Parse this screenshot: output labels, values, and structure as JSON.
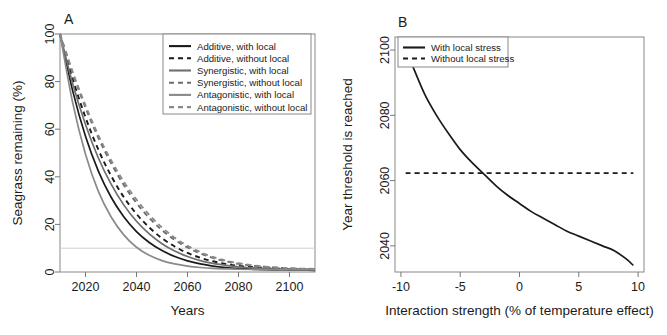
{
  "figure": {
    "panels": [
      "A",
      "B"
    ]
  },
  "chart_data": [
    {
      "type": "line",
      "panel_letter": "A",
      "title": "",
      "xlabel": "Years",
      "ylabel": "Seagrass remaining (%)",
      "xlim": [
        2010,
        2110
      ],
      "ylim": [
        0,
        100
      ],
      "xticks": [
        2020,
        2040,
        2060,
        2080,
        2100
      ],
      "yticks": [
        0,
        20,
        40,
        60,
        80,
        100
      ],
      "grid": false,
      "legend_position": "top-right",
      "annotations": [
        {
          "name": "threshold-line",
          "type": "hline",
          "y": 10,
          "color": "#d0d0d0",
          "style": "solid"
        }
      ],
      "x": [
        2010,
        2015,
        2020,
        2025,
        2030,
        2035,
        2040,
        2045,
        2050,
        2055,
        2060,
        2065,
        2070,
        2075,
        2080,
        2085,
        2090,
        2095,
        2100,
        2105,
        2110
      ],
      "series": [
        {
          "name": "Additive, with local",
          "color": "#1a1a1a",
          "style": "solid",
          "values": [
            100,
            76,
            57,
            42.5,
            31.5,
            23.2,
            17.0,
            12.4,
            9.0,
            6.5,
            4.7,
            3.4,
            2.5,
            1.9,
            1.5,
            1.2,
            1.0,
            0.9,
            0.8,
            0.75,
            0.7
          ]
        },
        {
          "name": "Additive, without local",
          "color": "#1a1a1a",
          "style": "dashed",
          "values": [
            100,
            81,
            65,
            51.5,
            40.5,
            31.5,
            24.4,
            18.7,
            14.2,
            10.7,
            8.0,
            6.0,
            4.5,
            3.4,
            2.6,
            2.1,
            1.7,
            1.4,
            1.2,
            1.1,
            1.0
          ]
        },
        {
          "name": "Synergistic, with local",
          "color": "#6e6e6e",
          "style": "solid",
          "values": [
            100,
            79,
            62,
            48,
            37,
            28.2,
            21.3,
            16.0,
            11.9,
            8.8,
            6.5,
            4.8,
            3.6,
            2.8,
            2.2,
            1.8,
            1.5,
            1.3,
            1.2,
            1.1,
            1.05
          ]
        },
        {
          "name": "Synergistic, without local",
          "color": "#6e6e6e",
          "style": "dashed",
          "values": [
            100,
            83.5,
            69,
            56.5,
            45.8,
            36.6,
            29.0,
            22.7,
            17.6,
            13.5,
            10.3,
            7.8,
            5.9,
            4.5,
            3.4,
            2.7,
            2.2,
            1.8,
            1.5,
            1.3,
            1.2
          ]
        },
        {
          "name": "Antagonistic, with local",
          "color": "#8a8a8a",
          "style": "solid",
          "values": [
            100,
            71,
            49.5,
            34,
            23.2,
            15.6,
            10.4,
            7.0,
            4.8,
            3.4,
            2.5,
            1.9,
            1.5,
            1.3,
            1.15,
            1.05,
            1.0,
            0.95,
            0.9,
            0.88,
            0.85
          ]
        },
        {
          "name": "Antagonistic, without local",
          "color": "#8a8a8a",
          "style": "dashed",
          "values": [
            100,
            84,
            70,
            57.5,
            47,
            38,
            30.4,
            24.0,
            18.7,
            14.4,
            11.0,
            8.4,
            6.3,
            4.8,
            3.7,
            2.9,
            2.3,
            1.9,
            1.6,
            1.4,
            1.3
          ]
        }
      ]
    },
    {
      "type": "line",
      "panel_letter": "B",
      "title": "",
      "xlabel": "Interaction strength (% of temperature effect)",
      "ylabel": "Year threshold is reached",
      "xlim": [
        -10.5,
        10.5
      ],
      "ylim": [
        2032,
        2104
      ],
      "xticks": [
        -10,
        -5,
        0,
        5,
        10
      ],
      "yticks": [
        2040,
        2060,
        2080,
        2100
      ],
      "grid": false,
      "legend_position": "top-left",
      "x": [
        -9.6,
        -9,
        -8,
        -7,
        -6,
        -5,
        -4,
        -3,
        -2,
        -1,
        0,
        1,
        2,
        3,
        4,
        5,
        6,
        7,
        8,
        9,
        9.6
      ],
      "series": [
        {
          "name": "With local stress",
          "color": "#1a1a1a",
          "style": "solid",
          "values": [
            2100.5,
            2095,
            2086.5,
            2080,
            2074.5,
            2069.5,
            2065.5,
            2062,
            2058.5,
            2055.5,
            2053,
            2050.5,
            2048.5,
            2046.5,
            2044.5,
            2043,
            2041.5,
            2040,
            2038.5,
            2036,
            2034
          ]
        },
        {
          "name": "Without local stress",
          "color": "#1a1a1a",
          "style": "dashed",
          "constant": 2062.3,
          "values": [
            2062.3,
            2062.3,
            2062.3,
            2062.3,
            2062.3,
            2062.3,
            2062.3,
            2062.3,
            2062.3,
            2062.3,
            2062.3,
            2062.3,
            2062.3,
            2062.3,
            2062.3,
            2062.3,
            2062.3,
            2062.3,
            2062.3,
            2062.3,
            2062.3
          ]
        }
      ]
    }
  ]
}
